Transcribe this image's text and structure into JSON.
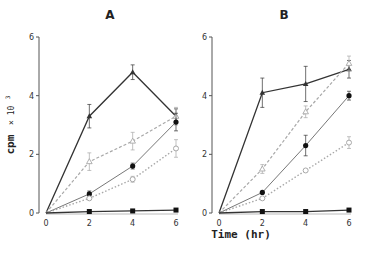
{
  "chart_data": [
    {
      "type": "line",
      "title": "A",
      "xlabel": "Time (hr)",
      "ylabel": "cpm × 10^3",
      "x": [
        0,
        2,
        4,
        6
      ],
      "xticks": [
        0,
        2,
        4,
        6
      ],
      "yticks": [
        0,
        2,
        4,
        6
      ],
      "xlim": [
        0,
        6
      ],
      "ylim": [
        0,
        6
      ],
      "grid": false,
      "series": [
        {
          "name": "filled-triangle",
          "marker": "filled-triangle",
          "line": "solid-dark",
          "values": [
            0,
            3.3,
            4.8,
            3.3
          ],
          "errors": [
            0,
            0.4,
            0.25,
            0.25
          ]
        },
        {
          "name": "open-triangle",
          "marker": "open-triangle",
          "line": "dashed",
          "values": [
            0,
            1.75,
            2.45,
            3.3
          ],
          "errors": [
            0,
            0.3,
            0.3,
            0.3
          ]
        },
        {
          "name": "filled-circle",
          "marker": "filled-circle",
          "line": "solid-light",
          "values": [
            0,
            0.65,
            1.6,
            3.1
          ],
          "errors": [
            0,
            0.1,
            0.1,
            0.3
          ]
        },
        {
          "name": "open-circle",
          "marker": "open-circle",
          "line": "dotted",
          "values": [
            0,
            0.5,
            1.15,
            2.2
          ],
          "errors": [
            0,
            0.05,
            0.1,
            0.3
          ]
        },
        {
          "name": "filled-square",
          "marker": "filled-square",
          "line": "solid-dark",
          "values": [
            0,
            0.05,
            0.07,
            0.1
          ],
          "errors": [
            0,
            0,
            0,
            0
          ]
        }
      ]
    },
    {
      "type": "line",
      "title": "B",
      "xlabel": "Time (hr)",
      "ylabel": "cpm × 10^3",
      "x": [
        0,
        2,
        4,
        6
      ],
      "xticks": [
        0,
        2,
        4,
        6
      ],
      "yticks": [
        0,
        2,
        4,
        6
      ],
      "xlim": [
        0,
        6
      ],
      "ylim": [
        0,
        6
      ],
      "grid": false,
      "series": [
        {
          "name": "filled-triangle",
          "marker": "filled-triangle",
          "line": "solid-dark",
          "values": [
            0,
            4.1,
            4.4,
            4.9
          ],
          "errors": [
            0,
            0.5,
            0.6,
            0.3
          ]
        },
        {
          "name": "open-triangle",
          "marker": "open-triangle",
          "line": "dashed",
          "values": [
            0,
            1.5,
            3.45,
            5.1
          ],
          "errors": [
            0,
            0.15,
            0.2,
            0.25
          ]
        },
        {
          "name": "filled-circle",
          "marker": "filled-circle",
          "line": "solid-light",
          "values": [
            0,
            0.7,
            2.3,
            4.0
          ],
          "errors": [
            0,
            0.05,
            0.35,
            0.15
          ]
        },
        {
          "name": "open-circle",
          "marker": "open-circle",
          "line": "dotted",
          "values": [
            0,
            0.5,
            1.45,
            2.4
          ],
          "errors": [
            0,
            0.05,
            0.05,
            0.2
          ]
        },
        {
          "name": "filled-square",
          "marker": "filled-square",
          "line": "solid-dark",
          "values": [
            0,
            0.05,
            0.05,
            0.1
          ],
          "errors": [
            0,
            0,
            0,
            0
          ]
        }
      ]
    }
  ],
  "labels": {
    "panel_a": "A",
    "panel_b": "B",
    "ylabel_main": "cpm",
    "ylabel_mult": "× 10",
    "ylabel_exp": "3",
    "xlabel": "Time  (hr)"
  },
  "layout": {
    "panels": [
      {
        "axis_x": 39,
        "x0": 46,
        "x6": 176,
        "title_x": 110
      },
      {
        "axis_x": 212,
        "x0": 219,
        "x6": 349,
        "title_x": 284
      }
    ],
    "y0": 213,
    "y6": 37
  },
  "colors": {
    "dark": "#333333",
    "mid": "#777777",
    "light": "#a8a8a8",
    "axis": "#555555"
  }
}
